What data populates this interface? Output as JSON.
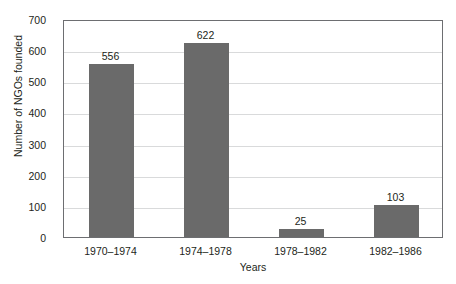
{
  "chart_data": {
    "type": "bar",
    "title": "",
    "subtitle": "",
    "categories": [
      "1970–1974",
      "1974–1978",
      "1978–1982",
      "1982–1986"
    ],
    "values": [
      556,
      622,
      25,
      103
    ],
    "value_labels": [
      "556",
      "622",
      "25",
      "103"
    ],
    "xlabel": "Years",
    "ylabel": "Number of NGOs founded",
    "ylim": [
      0,
      700
    ],
    "yticks": [
      700,
      600,
      500,
      400,
      300,
      200,
      100,
      0
    ],
    "ytick_labels": [
      "700",
      "600",
      "500",
      "400",
      "300",
      "200",
      "100",
      "0"
    ],
    "grid": "horizontal",
    "legend": "none",
    "bar_color": "#6a6a6a",
    "grid_color": "#d9dadb",
    "frame_color": "#6d6e71",
    "background": "#ffffff",
    "text_color": "#231f20"
  }
}
